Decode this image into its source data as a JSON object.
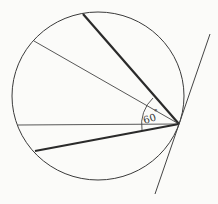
{
  "diagram": {
    "type": "geometry-circle-tangent",
    "circle": {
      "cx": 98,
      "cy": 96,
      "rx": 86,
      "ry": 84
    },
    "tangent_point": {
      "x": 179,
      "y": 124
    },
    "angle_label": "60°",
    "angle_label_parts": {
      "value": "60",
      "unit": "°"
    },
    "colors": {
      "stroke": "#333333",
      "background": "#fbfbf9"
    },
    "lines": [
      {
        "name": "upper-thick-chord",
        "x1": 83,
        "y1": 14,
        "x2": 179,
        "y2": 124,
        "weight": "thick"
      },
      {
        "name": "upper-thin-chord",
        "x1": 34,
        "y1": 41,
        "x2": 179,
        "y2": 124,
        "weight": "thin"
      },
      {
        "name": "horizontal-thin-chord",
        "x1": 18,
        "y1": 125,
        "x2": 179,
        "y2": 124,
        "weight": "thin"
      },
      {
        "name": "lower-thick-chord",
        "x1": 35,
        "y1": 151,
        "x2": 179,
        "y2": 124,
        "weight": "thick"
      },
      {
        "name": "tangent-line",
        "x1": 210,
        "y1": 34,
        "x2": 155,
        "y2": 194,
        "weight": "thin"
      }
    ]
  }
}
